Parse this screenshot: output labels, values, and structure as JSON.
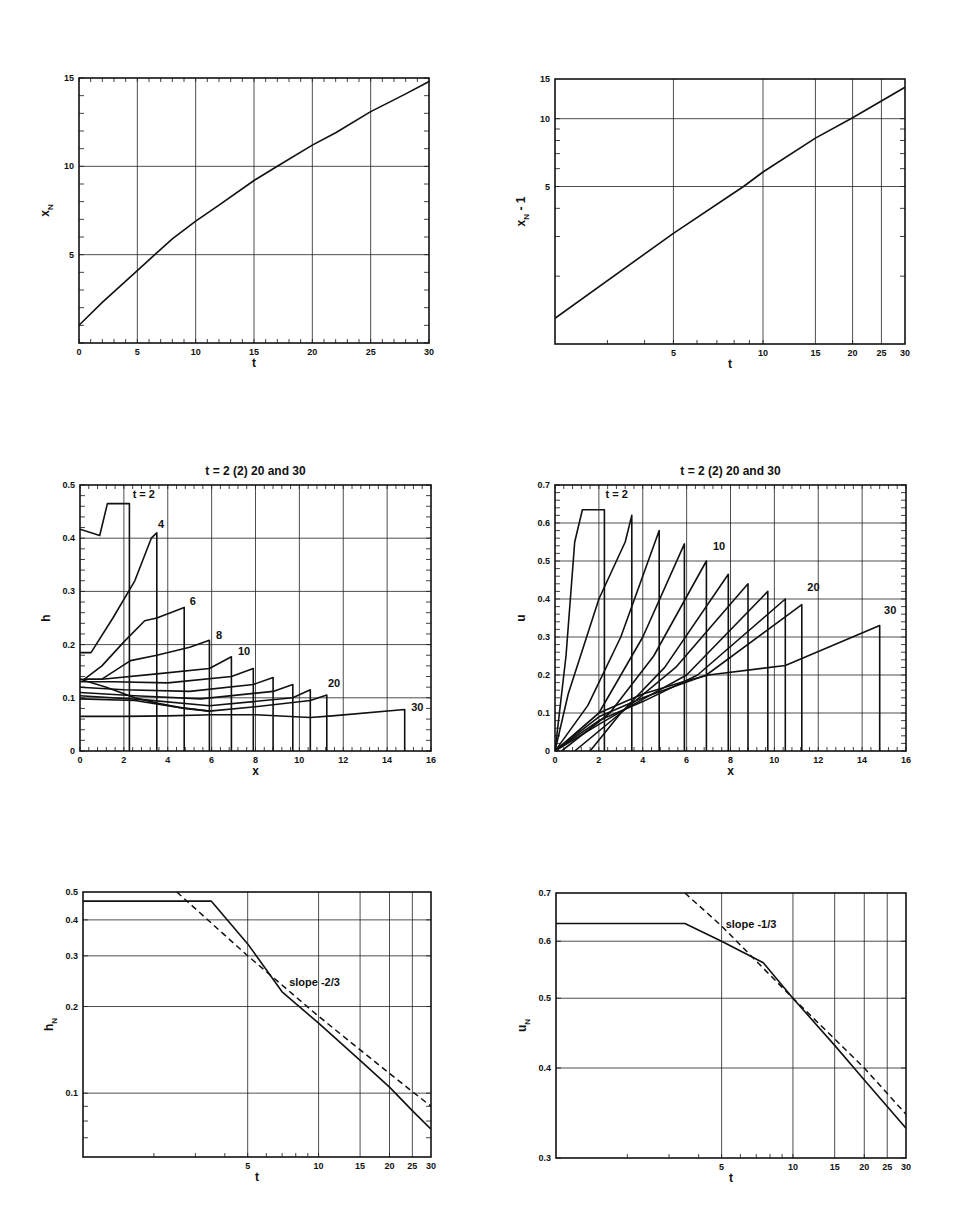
{
  "chart_data": [
    {
      "id": "xN_vs_t",
      "type": "line",
      "title": "",
      "xlabel": "t",
      "ylabel": "x_N",
      "xscale": "linear",
      "yscale": "linear",
      "xlim": [
        0,
        30
      ],
      "ylim": [
        0,
        15
      ],
      "xticks": [
        0,
        5,
        10,
        15,
        20,
        25,
        30
      ],
      "yticks": [
        5,
        10,
        15
      ],
      "grid": true,
      "box": [
        79,
        78,
        429,
        343
      ],
      "series": [
        {
          "name": "x_N",
          "style": "solid",
          "x": [
            0,
            2,
            4,
            5,
            6.5,
            8,
            10,
            12,
            15,
            17,
            20,
            22,
            25,
            28,
            30
          ],
          "y": [
            1.0,
            2.3,
            3.5,
            4.1,
            5.0,
            5.9,
            6.9,
            7.8,
            9.2,
            10.0,
            11.2,
            11.9,
            13.1,
            14.1,
            14.8
          ]
        }
      ],
      "annotations": []
    },
    {
      "id": "xN_minus_1_vs_t_loglog",
      "type": "line",
      "title": "",
      "xlabel": "t",
      "ylabel": "x_N - 1",
      "xscale": "log",
      "yscale": "log",
      "xlim": [
        2,
        30
      ],
      "ylim": [
        1,
        15
      ],
      "xticks": [
        5,
        10,
        15,
        20,
        25,
        30
      ],
      "yticks": [
        5,
        10,
        15
      ],
      "grid": true,
      "box": [
        555,
        79,
        905,
        344
      ],
      "series": [
        {
          "name": "x_N - 1",
          "style": "solid",
          "x": [
            2,
            5,
            8.6,
            10,
            15,
            20,
            30
          ],
          "y": [
            1.3,
            3.1,
            5.0,
            5.8,
            8.2,
            10.1,
            13.8
          ]
        }
      ],
      "annotations": []
    },
    {
      "id": "h_vs_x",
      "type": "line",
      "title": "t = 2  (2) 20  and  30",
      "xlabel": "x",
      "ylabel": "h",
      "xscale": "linear",
      "yscale": "linear",
      "xlim": [
        0,
        16
      ],
      "ylim": [
        0,
        0.5
      ],
      "xticks": [
        0,
        2,
        4,
        6,
        8,
        10,
        12,
        14,
        16
      ],
      "yticks": [
        0,
        0.1,
        0.2,
        0.3,
        0.4,
        0.5
      ],
      "grid": true,
      "box": [
        80,
        485,
        431,
        751
      ],
      "series": [
        {
          "name": "t=2",
          "style": "solid",
          "x": [
            0,
            0.9,
            1.25,
            2.25,
            2.25
          ],
          "y": [
            0.417,
            0.405,
            0.465,
            0.465,
            0
          ]
        },
        {
          "name": "t=4",
          "style": "solid",
          "x": [
            0,
            0.5,
            1.5,
            2.5,
            3.25,
            3.5,
            3.5
          ],
          "y": [
            0.185,
            0.185,
            0.25,
            0.32,
            0.4,
            0.41,
            0
          ]
        },
        {
          "name": "t=6",
          "style": "solid",
          "x": [
            0.2,
            1.0,
            2.0,
            2.95,
            3.5,
            4.75,
            4.75
          ],
          "y": [
            0.135,
            0.16,
            0.205,
            0.245,
            0.25,
            0.27,
            0
          ]
        },
        {
          "name": "t=8",
          "style": "solid",
          "x": [
            0.2,
            1.0,
            2.3,
            3.5,
            5.0,
            5.9,
            5.9
          ],
          "y": [
            0.135,
            0.135,
            0.17,
            0.18,
            0.195,
            0.208,
            0
          ]
        },
        {
          "name": "t=10",
          "style": "solid",
          "x": [
            0,
            1.0,
            3.5,
            5.9,
            6.9,
            6.9
          ],
          "y": [
            0.135,
            0.135,
            0.145,
            0.155,
            0.177,
            0
          ]
        },
        {
          "name": "t=12",
          "style": "solid",
          "x": [
            0,
            1.5,
            4.0,
            6.9,
            7.9,
            7.9
          ],
          "y": [
            0.13,
            0.13,
            0.128,
            0.14,
            0.155,
            0
          ]
        },
        {
          "name": "t=14",
          "style": "solid",
          "x": [
            0,
            2.0,
            5.0,
            7.9,
            8.8,
            8.8
          ],
          "y": [
            0.12,
            0.115,
            0.112,
            0.125,
            0.138,
            0
          ]
        },
        {
          "name": "t=16",
          "style": "solid",
          "x": [
            0,
            2.5,
            5.5,
            8.8,
            9.7,
            9.7
          ],
          "y": [
            0.11,
            0.104,
            0.098,
            0.112,
            0.125,
            0
          ]
        },
        {
          "name": "t=18",
          "style": "solid",
          "x": [
            0,
            3.0,
            5.9,
            9.7,
            10.5,
            10.5
          ],
          "y": [
            0.104,
            0.096,
            0.085,
            0.1,
            0.115,
            0
          ]
        },
        {
          "name": "t=20",
          "style": "solid",
          "x": [
            0,
            2.5,
            4.5,
            5.9,
            8.0,
            10.5,
            11.25,
            11.25
          ],
          "y": [
            0.098,
            0.095,
            0.082,
            0.075,
            0.083,
            0.095,
            0.105,
            0
          ]
        },
        {
          "name": "t=30",
          "style": "solid",
          "x": [
            0,
            2,
            4,
            6,
            8,
            10.5,
            11.5,
            14.8,
            14.8
          ],
          "y": [
            0.065,
            0.065,
            0.066,
            0.068,
            0.068,
            0.063,
            0.066,
            0.078,
            0
          ]
        },
        {
          "name": "converge",
          "style": "solid",
          "x": [
            0,
            1.2,
            2.5,
            3.5,
            4.75,
            5.9
          ],
          "y": [
            0.135,
            0.12,
            0.1,
            0.09,
            0.08,
            0.075
          ]
        }
      ],
      "annotations": [
        {
          "text": "t = 2",
          "x": 2.4,
          "y": 0.475
        },
        {
          "text": "4",
          "x": 3.55,
          "y": 0.42
        },
        {
          "text": "6",
          "x": 5.0,
          "y": 0.275
        },
        {
          "text": "8",
          "x": 6.2,
          "y": 0.21
        },
        {
          "text": "10",
          "x": 7.2,
          "y": 0.18
        },
        {
          "text": "20",
          "x": 11.3,
          "y": 0.12
        },
        {
          "text": "30",
          "x": 15.1,
          "y": 0.075
        }
      ]
    },
    {
      "id": "u_vs_x",
      "type": "line",
      "title": "t = 2  (2) 20  and  30",
      "xlabel": "x",
      "ylabel": "u",
      "xscale": "linear",
      "yscale": "linear",
      "xlim": [
        0,
        16
      ],
      "ylim": [
        0,
        0.7
      ],
      "xticks": [
        0,
        2,
        4,
        6,
        8,
        10,
        12,
        14,
        16
      ],
      "yticks": [
        0,
        0.1,
        0.2,
        0.3,
        0.4,
        0.5,
        0.6,
        0.7
      ],
      "grid": true,
      "box": [
        555,
        485,
        906,
        751
      ],
      "series": [
        {
          "name": "t=2",
          "style": "solid",
          "x": [
            0,
            0.5,
            0.9,
            1.25,
            2.25,
            2.25
          ],
          "y": [
            0,
            0.25,
            0.55,
            0.635,
            0.635,
            0
          ]
        },
        {
          "name": "t=4",
          "style": "solid",
          "x": [
            0,
            0.6,
            2.0,
            3.2,
            3.5,
            3.5
          ],
          "y": [
            0,
            0.15,
            0.4,
            0.55,
            0.62,
            0
          ]
        },
        {
          "name": "t=6",
          "style": "solid",
          "x": [
            0,
            1.5,
            3.0,
            4.75,
            4.75
          ],
          "y": [
            0,
            0.12,
            0.3,
            0.58,
            0
          ]
        },
        {
          "name": "t=8",
          "style": "solid",
          "x": [
            0,
            2.0,
            4.0,
            5.9,
            5.9
          ],
          "y": [
            0,
            0.1,
            0.3,
            0.545,
            0
          ]
        },
        {
          "name": "t=10",
          "style": "solid",
          "x": [
            0.3,
            2.5,
            4.5,
            6.9,
            6.9
          ],
          "y": [
            0,
            0.1,
            0.25,
            0.5,
            0
          ]
        },
        {
          "name": "t=12",
          "style": "solid",
          "x": [
            0.9,
            3.0,
            5.0,
            7.9,
            7.9
          ],
          "y": [
            0,
            0.1,
            0.22,
            0.465,
            0
          ]
        },
        {
          "name": "t=14",
          "style": "solid",
          "x": [
            1.6,
            3.0,
            5.5,
            8.8,
            8.8
          ],
          "y": [
            0,
            0.1,
            0.22,
            0.44,
            0
          ]
        },
        {
          "name": "t=16",
          "style": "solid",
          "x": [
            0,
            2.0,
            3.5,
            6.0,
            9.7,
            9.7
          ],
          "y": [
            0,
            0.07,
            0.12,
            0.2,
            0.42,
            0
          ]
        },
        {
          "name": "t=18",
          "style": "solid",
          "x": [
            0,
            2.0,
            4.0,
            6.5,
            10.5,
            10.5
          ],
          "y": [
            0,
            0.08,
            0.13,
            0.2,
            0.4,
            0
          ]
        },
        {
          "name": "t=20",
          "style": "solid",
          "x": [
            0,
            2.0,
            4.0,
            6.9,
            11.25,
            11.25
          ],
          "y": [
            0,
            0.09,
            0.14,
            0.2,
            0.385,
            0
          ]
        },
        {
          "name": "t=30",
          "style": "solid",
          "x": [
            0,
            2.0,
            4.0,
            6.0,
            7.0,
            10.5,
            14.8,
            14.8
          ],
          "y": [
            0,
            0.1,
            0.15,
            0.185,
            0.2,
            0.225,
            0.33,
            0
          ]
        }
      ],
      "annotations": [
        {
          "text": "t = 2",
          "x": 2.3,
          "y": 0.665
        },
        {
          "text": "10",
          "x": 7.2,
          "y": 0.53
        },
        {
          "text": "20",
          "x": 11.5,
          "y": 0.42
        },
        {
          "text": "30",
          "x": 15.0,
          "y": 0.36
        }
      ]
    },
    {
      "id": "hN_vs_t_loglog",
      "type": "line",
      "title": "",
      "xlabel": "t",
      "ylabel": "h_N",
      "xscale": "log",
      "yscale": "log",
      "xlim": [
        1,
        30
      ],
      "ylim": [
        0.06,
        0.5
      ],
      "xticks": [
        5,
        10,
        15,
        20,
        25,
        30
      ],
      "yticks": [
        0.1,
        0.2,
        0.3,
        0.4,
        0.5
      ],
      "grid": true,
      "box": [
        83,
        892,
        431,
        1157
      ],
      "series": [
        {
          "name": "h_N",
          "style": "solid",
          "x": [
            1,
            3.5,
            5,
            7,
            10,
            15,
            20,
            25,
            30
          ],
          "y": [
            0.465,
            0.465,
            0.33,
            0.225,
            0.175,
            0.13,
            0.105,
            0.087,
            0.075
          ]
        },
        {
          "name": "slope -2/3 reference",
          "style": "dashed",
          "x": [
            2.5,
            5,
            10,
            20,
            30
          ],
          "y": [
            0.5,
            0.3,
            0.185,
            0.117,
            0.09
          ]
        }
      ],
      "annotations": [
        {
          "text": "slope -2/3",
          "x": 7.5,
          "y": 0.235
        }
      ]
    },
    {
      "id": "uN_vs_t_loglog",
      "type": "line",
      "title": "",
      "xlabel": "t",
      "ylabel": "u_N",
      "xscale": "log",
      "yscale": "log",
      "xlim": [
        1,
        30
      ],
      "ylim": [
        0.3,
        0.7
      ],
      "xticks": [
        5,
        10,
        15,
        20,
        25,
        30
      ],
      "yticks": [
        0.3,
        0.4,
        0.5,
        0.6,
        0.7
      ],
      "grid": true,
      "box": [
        556,
        893,
        906,
        1158
      ],
      "series": [
        {
          "name": "u_N",
          "style": "solid",
          "x": [
            1,
            3.5,
            5,
            7.5,
            10,
            15,
            20,
            30
          ],
          "y": [
            0.635,
            0.635,
            0.6,
            0.56,
            0.5,
            0.43,
            0.385,
            0.33
          ]
        },
        {
          "name": "slope -1/3 reference",
          "style": "dashed",
          "x": [
            3.5,
            5,
            10,
            20,
            30
          ],
          "y": [
            0.7,
            0.63,
            0.5,
            0.4,
            0.345
          ]
        }
      ],
      "annotations": [
        {
          "text": "slope  -1/3",
          "x": 5.2,
          "y": 0.625
        }
      ]
    }
  ],
  "panels": {
    "p1": {
      "ylabel": "x",
      "ysub": "N",
      "xlabel": "t"
    },
    "p2": {
      "ylabel": "x",
      "ysub": "N",
      "ysuffix": " - 1",
      "xlabel": "t"
    },
    "p3": {
      "ylabel": "h",
      "xlabel": "x",
      "title": "t = 2  (2) 20  and  30"
    },
    "p4": {
      "ylabel": "u",
      "xlabel": "x",
      "title": "t = 2  (2) 20  and  30"
    },
    "p5": {
      "ylabel": "h",
      "ysub": "N",
      "xlabel": "t"
    },
    "p6": {
      "ylabel": "u",
      "ysub": "N",
      "xlabel": "t"
    }
  }
}
